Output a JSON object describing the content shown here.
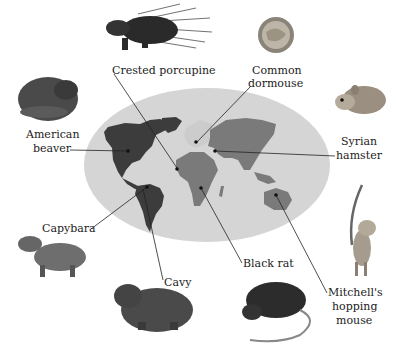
{
  "map": {
    "ocean_color": "#d4d4d4",
    "americas_color": "#3e3e3e",
    "old_world_color": "#7a7a7a",
    "europe_color": "#cfcfcf"
  },
  "labels": {
    "crested_porcupine": "Crested porcupine",
    "common_dormouse_1": "Common",
    "common_dormouse_2": "dormouse",
    "american_beaver_1": "American",
    "american_beaver_2": "beaver",
    "syrian_hamster_1": "Syrian",
    "syrian_hamster_2": "hamster",
    "capybara": "Capybara",
    "cavy": "Cavy",
    "black_rat": "Black rat",
    "mitchells_1": "Mitchell's",
    "mitchells_2": "hopping",
    "mitchells_3": "mouse"
  }
}
